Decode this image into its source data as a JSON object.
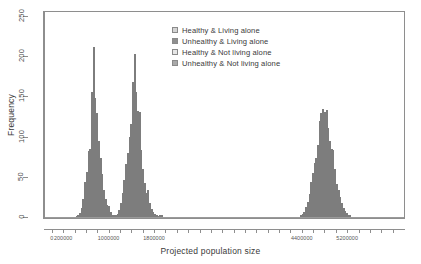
{
  "chart_data": {
    "type": "bar",
    "chart_subtype": "histogram-overlaid",
    "title": "",
    "xlabel": "Projected population size",
    "ylabel": "Frequency",
    "xlim": [
      -120000,
      6200000
    ],
    "ylim": [
      0,
      255
    ],
    "grid": false,
    "legend_position": "top-center",
    "y_ticks": [
      0,
      50,
      100,
      150,
      200,
      250
    ],
    "y_tick_labels": [
      "0",
      "50",
      "100",
      "150",
      "200",
      "250"
    ],
    "x_ticks": [
      0,
      200000,
      1000000,
      1800000,
      4400000,
      5200000
    ],
    "x_tick_labels": [
      "0",
      "200000",
      "1000000",
      "1800000",
      "4400000",
      "5200000"
    ],
    "x_minor_ticks": [
      0,
      200000,
      400000,
      600000,
      800000,
      1000000,
      1200000,
      1400000,
      1600000,
      1800000,
      2000000,
      2200000,
      2400000,
      2600000,
      2800000,
      3000000,
      3200000,
      3400000,
      3600000,
      3800000,
      4000000,
      4200000,
      4400000,
      4600000,
      4800000,
      5000000,
      5200000,
      5400000,
      5600000,
      5800000,
      6000000
    ],
    "bin_width": 30000,
    "series": [
      {
        "name": "Healthy & Living alone",
        "color": "#d4d4d4",
        "bins": [
          {
            "x": 1110000,
            "y": 2
          },
          {
            "x": 1140000,
            "y": 4
          },
          {
            "x": 1170000,
            "y": 9
          },
          {
            "x": 1200000,
            "y": 17
          },
          {
            "x": 1230000,
            "y": 30
          },
          {
            "x": 1260000,
            "y": 46
          },
          {
            "x": 1290000,
            "y": 66
          },
          {
            "x": 1320000,
            "y": 80
          },
          {
            "x": 1350000,
            "y": 92
          },
          {
            "x": 1380000,
            "y": 93
          },
          {
            "x": 1410000,
            "y": 122
          },
          {
            "x": 1440000,
            "y": 133
          },
          {
            "x": 1470000,
            "y": 126
          },
          {
            "x": 1500000,
            "y": 110
          },
          {
            "x": 1530000,
            "y": 95
          },
          {
            "x": 1560000,
            "y": 83
          },
          {
            "x": 1590000,
            "y": 60
          },
          {
            "x": 1620000,
            "y": 42
          },
          {
            "x": 1650000,
            "y": 30
          },
          {
            "x": 1680000,
            "y": 21
          },
          {
            "x": 1710000,
            "y": 13
          },
          {
            "x": 1740000,
            "y": 8
          },
          {
            "x": 1770000,
            "y": 5
          },
          {
            "x": 1800000,
            "y": 3
          },
          {
            "x": 1830000,
            "y": 2
          },
          {
            "x": 1860000,
            "y": 1
          }
        ]
      },
      {
        "name": "Unhealthy & Living alone",
        "color": "#8f8f8f",
        "bins": [
          {
            "x": 420000,
            "y": 1
          },
          {
            "x": 450000,
            "y": 2
          },
          {
            "x": 480000,
            "y": 5
          },
          {
            "x": 510000,
            "y": 11
          },
          {
            "x": 540000,
            "y": 22
          },
          {
            "x": 570000,
            "y": 44
          },
          {
            "x": 600000,
            "y": 56
          },
          {
            "x": 630000,
            "y": 82
          },
          {
            "x": 660000,
            "y": 85
          },
          {
            "x": 690000,
            "y": 156
          },
          {
            "x": 720000,
            "y": 211
          },
          {
            "x": 750000,
            "y": 148
          },
          {
            "x": 780000,
            "y": 130
          },
          {
            "x": 810000,
            "y": 95
          },
          {
            "x": 840000,
            "y": 74
          },
          {
            "x": 870000,
            "y": 53
          },
          {
            "x": 900000,
            "y": 33
          },
          {
            "x": 930000,
            "y": 23
          },
          {
            "x": 960000,
            "y": 15
          },
          {
            "x": 990000,
            "y": 14
          },
          {
            "x": 1020000,
            "y": 6
          },
          {
            "x": 1050000,
            "y": 3
          },
          {
            "x": 1080000,
            "y": 2
          }
        ]
      },
      {
        "name": "Healthy & Not living alone",
        "color": "#e6e6e6",
        "bins": [
          {
            "x": 4370000,
            "y": 3
          },
          {
            "x": 4400000,
            "y": 4
          },
          {
            "x": 4430000,
            "y": 6
          },
          {
            "x": 4460000,
            "y": 12
          },
          {
            "x": 4490000,
            "y": 19
          },
          {
            "x": 4520000,
            "y": 29
          },
          {
            "x": 4550000,
            "y": 43
          },
          {
            "x": 4580000,
            "y": 55
          },
          {
            "x": 4610000,
            "y": 67
          },
          {
            "x": 4640000,
            "y": 74
          },
          {
            "x": 4670000,
            "y": 90
          },
          {
            "x": 4700000,
            "y": 119
          },
          {
            "x": 4730000,
            "y": 130
          },
          {
            "x": 4760000,
            "y": 134
          },
          {
            "x": 4790000,
            "y": 131
          },
          {
            "x": 4820000,
            "y": 133
          },
          {
            "x": 4850000,
            "y": 111
          },
          {
            "x": 4880000,
            "y": 95
          },
          {
            "x": 4910000,
            "y": 84
          },
          {
            "x": 4940000,
            "y": 83
          },
          {
            "x": 4970000,
            "y": 60
          },
          {
            "x": 5000000,
            "y": 41
          },
          {
            "x": 5030000,
            "y": 33
          },
          {
            "x": 5060000,
            "y": 25
          },
          {
            "x": 5090000,
            "y": 17
          },
          {
            "x": 5120000,
            "y": 11
          },
          {
            "x": 5150000,
            "y": 7
          },
          {
            "x": 5180000,
            "y": 5
          },
          {
            "x": 5210000,
            "y": 3
          },
          {
            "x": 5240000,
            "y": 2
          }
        ]
      },
      {
        "name": "Unhealthy & Not living alone",
        "color": "#a9a9a9",
        "bins": [
          {
            "x": 1080000,
            "y": 1
          },
          {
            "x": 1110000,
            "y": 2
          },
          {
            "x": 1140000,
            "y": 3
          },
          {
            "x": 1170000,
            "y": 7
          },
          {
            "x": 1200000,
            "y": 13
          },
          {
            "x": 1230000,
            "y": 24
          },
          {
            "x": 1260000,
            "y": 39
          },
          {
            "x": 1290000,
            "y": 58
          },
          {
            "x": 1320000,
            "y": 76
          },
          {
            "x": 1350000,
            "y": 99
          },
          {
            "x": 1380000,
            "y": 116
          },
          {
            "x": 1410000,
            "y": 168
          },
          {
            "x": 1440000,
            "y": 203
          },
          {
            "x": 1470000,
            "y": 156
          },
          {
            "x": 1500000,
            "y": 132
          },
          {
            "x": 1530000,
            "y": 131
          },
          {
            "x": 1560000,
            "y": 79
          },
          {
            "x": 1590000,
            "y": 53
          },
          {
            "x": 1620000,
            "y": 36
          },
          {
            "x": 1650000,
            "y": 25
          },
          {
            "x": 1680000,
            "y": 33
          },
          {
            "x": 1710000,
            "y": 18
          },
          {
            "x": 1740000,
            "y": 10
          },
          {
            "x": 1770000,
            "y": 6
          },
          {
            "x": 1800000,
            "y": 4
          },
          {
            "x": 1830000,
            "y": 3
          },
          {
            "x": 1890000,
            "y": 2
          },
          {
            "x": 1920000,
            "y": 2
          }
        ]
      }
    ]
  },
  "legend": {
    "items": [
      {
        "label": "Healthy & Living alone",
        "color": "#d4d4d4"
      },
      {
        "label": "Unhealthy & Living alone",
        "color": "#8f8f8f"
      },
      {
        "label": "Healthy & Not living alone",
        "color": "#e6e6e6"
      },
      {
        "label": "Unhealthy & Not living alone",
        "color": "#a9a9a9"
      }
    ]
  },
  "axes": {
    "x_title": "Projected population size",
    "y_title": "Frequency"
  }
}
